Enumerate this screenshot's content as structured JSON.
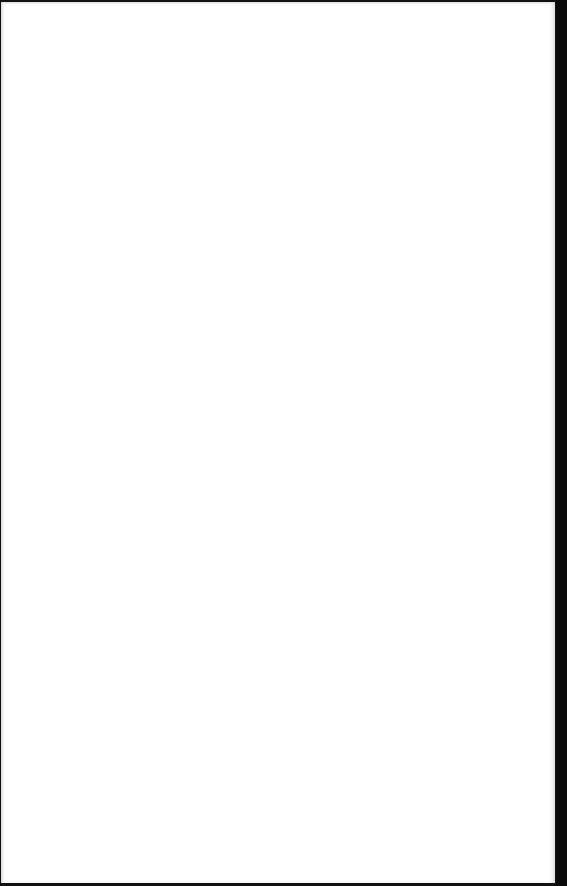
{
  "document": {
    "type": "scanned-page",
    "content": "",
    "colors": {
      "paper": "#ffffff",
      "scan_border": "#0a0a0a"
    }
  }
}
